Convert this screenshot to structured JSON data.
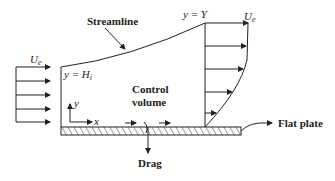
{
  "diagram": {
    "labels": {
      "streamline": "Streamline",
      "y_equals_Y": "y = Y",
      "Ue_left": "U",
      "Ue_left_sub": "e",
      "Ue_right": "U",
      "Ue_right_sub": "e",
      "y_equals_Hi": "y = H",
      "Hi_sub": "i",
      "control_volume_1": "Control",
      "control_volume_2": "volume",
      "axis_y": "y",
      "axis_x": "x",
      "drag": "Drag",
      "flat_plate": "Flat plate"
    },
    "colors": {
      "line": "#222222",
      "background": "#ffffff"
    }
  }
}
